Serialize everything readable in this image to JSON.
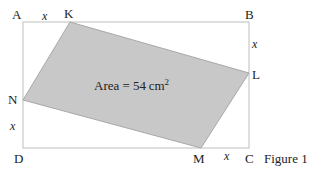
{
  "figure": {
    "caption": "Figure 1",
    "area_label": "Area = 54",
    "area_unit": "cm",
    "area_exponent": "2",
    "vertices": {
      "A": "A",
      "B": "B",
      "C": "C",
      "D": "D",
      "K": "K",
      "L": "L",
      "M": "M",
      "N": "N"
    },
    "variables": {
      "AK": "x",
      "BL": "x",
      "CM": "x",
      "DN": "x"
    },
    "colors": {
      "fill": "#c8c8c8",
      "rect_stroke": "#c8c8c8",
      "shape_stroke": "#9a9a9a"
    }
  }
}
